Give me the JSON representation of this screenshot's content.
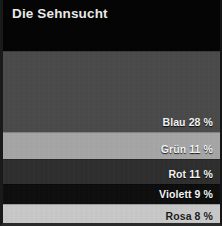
{
  "header": {
    "title": "Die Sehnsucht"
  },
  "chart_data": {
    "type": "bar",
    "orientation": "stacked-horizontal-bands",
    "title": "Die Sehnsucht",
    "xlabel": "",
    "ylabel": "",
    "grid": false,
    "legend": "inline-right",
    "categories": [
      "Blau",
      "Grün",
      "Rot",
      "Violett",
      "Rosa"
    ],
    "values": [
      28,
      11,
      11,
      9,
      8
    ],
    "unit": "%",
    "ylim": [
      0,
      28
    ],
    "series": [
      {
        "name": "Anteil",
        "values": [
          28,
          11,
          11,
          9,
          8
        ]
      }
    ],
    "bands": [
      {
        "name": "Blau",
        "value": 28,
        "label": "Blau 28 %",
        "color": "#4a4a4a",
        "label_color": "#f2f2f2",
        "label_tone": "light",
        "top_px": 0,
        "height_px": 81
      },
      {
        "name": "Grün",
        "value": 11,
        "label": "Grün 11 %",
        "color": "#a6a6a6",
        "label_color": "#f2f2f2",
        "label_tone": "light",
        "top_px": 81,
        "height_px": 27
      },
      {
        "name": "Rot",
        "value": 11,
        "label": "Rot 11 %",
        "color": "#2e2e2e",
        "label_color": "#f2f2f2",
        "label_tone": "light",
        "top_px": 108,
        "height_px": 25
      },
      {
        "name": "Violett",
        "value": 9,
        "label": "Violett 9 %",
        "color": "#0d0d0d",
        "label_color": "#f2f2f2",
        "label_tone": "light",
        "top_px": 133,
        "height_px": 20
      },
      {
        "name": "Rosa",
        "value": 8,
        "label": "Rosa 8 %",
        "color": "#c9c9c9",
        "label_color": "#1c1c1c",
        "label_tone": "dark",
        "top_px": 153,
        "height_px": 22
      }
    ],
    "background_color": "#050505",
    "title_color": "#e9e9e9"
  }
}
